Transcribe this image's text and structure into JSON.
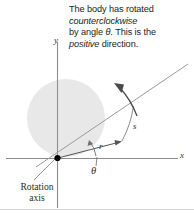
{
  "figure": {
    "type": "physics-diagram",
    "width": 194,
    "height": 214,
    "background_color": "#ffffff"
  },
  "caption": {
    "line1": "The body has rotated",
    "line2_italic": "counterclockwise",
    "line3a": "by angle ",
    "line3b_symbol": "θ",
    "line3c": ". This is the",
    "line4_italic": "positive",
    "line4b": " direction."
  },
  "axes": {
    "x_label": "x",
    "y_label": "y",
    "axis_color": "#8c8c8c",
    "origin_dot_color": "#000000"
  },
  "body": {
    "shape": "disk",
    "fill_color": "#e8e8e8"
  },
  "labels": {
    "radius": "r",
    "arc_length": "s",
    "angle": "θ",
    "reference_line_1": "Reference",
    "reference_line_2": "line",
    "rotation_axis_1": "Rotation",
    "rotation_axis_2": "axis"
  },
  "elements": {
    "reference_line_color": "#9a9a9a",
    "radius_vector_color": "#555555",
    "arc_color": "#8a8a8a",
    "rotation_arrow_color": "#4a4a4a",
    "leader_line_color": "#8c8c8c",
    "border_color": "#d4d4d4"
  }
}
